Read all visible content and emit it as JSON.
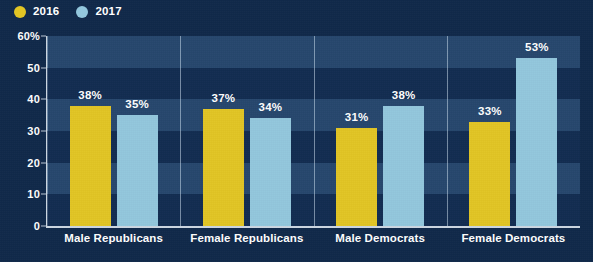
{
  "colors": {
    "background": "#10294a",
    "series_2016": "#e2c524",
    "series_2017": "#93c7dd",
    "axis": "#ccd7e2",
    "text": "#ffffff",
    "band_light": "#335a82",
    "band_dark": "#132f54"
  },
  "legend": {
    "position": "top-left",
    "items": [
      {
        "label": "2016",
        "color": "#e2c524",
        "marker": "circle"
      },
      {
        "label": "2017",
        "color": "#93c7dd",
        "marker": "circle"
      }
    ]
  },
  "chart_data": {
    "type": "bar",
    "title": "",
    "subtitle": "",
    "xlabel": "",
    "ylabel": "",
    "categories": [
      "Male Republicans",
      "Female Republicans",
      "Male Democrats",
      "Female Democrats"
    ],
    "series": [
      {
        "name": "2016",
        "color": "#e2c524",
        "values": [
          38,
          37,
          31,
          33
        ],
        "labels": [
          "38%",
          "37%",
          "31%",
          "33%"
        ]
      },
      {
        "name": "2017",
        "color": "#93c7dd",
        "values": [
          35,
          34,
          38,
          53
        ],
        "labels": [
          "35%",
          "34%",
          "38%",
          "53%"
        ]
      }
    ],
    "ylim": [
      0,
      60
    ],
    "yticks": [
      0,
      10,
      20,
      30,
      40,
      50,
      60
    ],
    "ytick_labels": [
      "0",
      "10",
      "20",
      "30",
      "40",
      "50",
      "60%"
    ],
    "grid": "horizontal-bands",
    "legend_position": "top-left",
    "group_separators": true
  }
}
